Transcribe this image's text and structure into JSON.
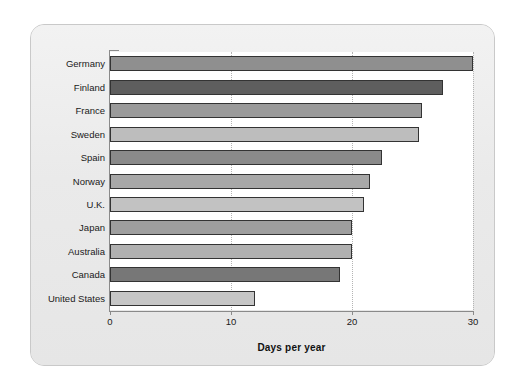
{
  "chart_data": {
    "type": "bar",
    "orientation": "horizontal",
    "title": "",
    "subtitle": "",
    "xlabel": "Days per year",
    "ylabel": "",
    "xlim": [
      0,
      30
    ],
    "xticks": [
      0,
      10,
      20,
      30
    ],
    "xtick_labels": [
      "0",
      "10",
      "20",
      "30"
    ],
    "grid": "vertical-dotted",
    "legend": "none",
    "categories": [
      "Germany",
      "Finland",
      "France",
      "Sweden",
      "Spain",
      "Norway",
      "U.K.",
      "Japan",
      "Australia",
      "Canada",
      "United States"
    ],
    "values": [
      30.0,
      27.5,
      25.8,
      25.5,
      22.5,
      21.5,
      21.0,
      20.0,
      20.0,
      19.0,
      12.0
    ],
    "bar_colors": [
      "#8f8f8f",
      "#5e5e5e",
      "#9a9a9a",
      "#bdbdbd",
      "#8a8a8a",
      "#a8a8a8",
      "#c2c2c2",
      "#9e9e9e",
      "#b0b0b0",
      "#777777",
      "#c6c6c6"
    ],
    "bar_border_color": "#333333"
  },
  "panel": {
    "background_color": "#ececec",
    "border_color": "#c9c9c9"
  },
  "plot": {
    "background_color": "#ffffff",
    "axis_color": "#8a8a8a",
    "gridline_color": "#b4b4b4"
  }
}
